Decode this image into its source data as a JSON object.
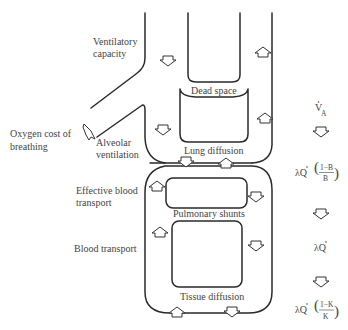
{
  "labels": {
    "ventilatory_capacity_1": "Ventilatory",
    "ventilatory_capacity_2": "capacity",
    "oxygen_cost_1": "Oxygen cost of",
    "oxygen_cost_2": "breathing",
    "alveolar_ventilation_1": "Alveolar",
    "alveolar_ventilation_2": "ventilation",
    "dead_space": "Dead space",
    "lung_diffusion": "Lung diffusion",
    "effective_blood_transport_1": "Effective blood",
    "effective_blood_transport_2": "transport",
    "pulmonary_shunts": "Pulmonary shunts",
    "blood_transport": "Blood transport",
    "tissue_diffusion": "Tissue diffusion"
  },
  "equations": {
    "va": {
      "symbol": "V",
      "subscript": "A"
    },
    "lung": {
      "prefix": "λQ",
      "numerator": "1−B",
      "denominator": "B"
    },
    "blood": {
      "prefix": "λQ"
    },
    "tissue": {
      "prefix": "λQ",
      "numerator": "1−K",
      "denominator": "K"
    }
  },
  "colors": {
    "line": "#2a2a2a",
    "text": "#444444",
    "background": "#ffffff"
  }
}
